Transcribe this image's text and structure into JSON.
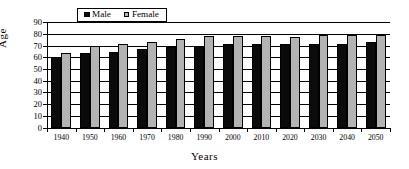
{
  "chart_data": {
    "type": "bar",
    "title": "",
    "xlabel": "Years",
    "ylabel": "Age",
    "categories": [
      "1940",
      "1950",
      "1960",
      "1970",
      "1980",
      "1990",
      "2000",
      "2010",
      "2020",
      "2030",
      "2040",
      "2050"
    ],
    "series": [
      {
        "name": "Male",
        "color": "#0b0b0b",
        "values": [
          60,
          64,
          65,
          67,
          69,
          70,
          71,
          71,
          71,
          71,
          71,
          73
        ]
      },
      {
        "name": "Female",
        "color": "#b3b3b3",
        "values": [
          64,
          70,
          71,
          73,
          76,
          78,
          78,
          78,
          77,
          79,
          79,
          79
        ]
      }
    ],
    "ylim": [
      0,
      90
    ],
    "ytick_step": 10,
    "yticks": [
      "0",
      "10",
      "20",
      "30",
      "40",
      "50",
      "60",
      "70",
      "80",
      "90"
    ],
    "grid": "horizontal",
    "legend_position": "top-center",
    "legend_entries": [
      "Male",
      "Female"
    ]
  },
  "legend": {
    "male_label": "Male",
    "female_label": "Female"
  },
  "axes": {
    "y_title": "Age",
    "x_title": "Years"
  }
}
